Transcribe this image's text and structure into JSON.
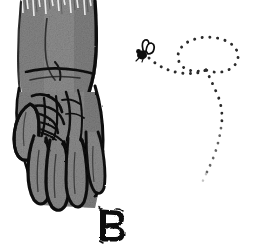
{
  "figure": {
    "label": "B",
    "caption": "Hand-drawn ink and grey wash illustration of a hand and forearm with a fly tracing a looping dotted flight path",
    "background_color": "#ffffff",
    "ink_color": "#111111",
    "wash_color": "#8b8b8b",
    "wash_color_dark": "#6f6f6f",
    "wash_color_light": "#a6a6a6",
    "trail_dot_color": "#2b2b2b",
    "trail_fade_color": "#c9c9c9",
    "width": 257,
    "height": 247
  },
  "subjects": {
    "hand": {
      "name": "hand",
      "description": "Back of a hand with four splayed fingers and a thumb at left, drawn in heavy black ink outline filled with grey pencil wash",
      "forearm_description": "Forearm rising to a ragged brush-cut top edge at the image border",
      "finger_count": 4,
      "thumb_count": 1
    },
    "fly": {
      "name": "fly",
      "description": "Small black insect with two outlined wings, hovering above and right of the hand",
      "x": 144,
      "y": 52
    },
    "flight_path": {
      "name": "flight-path",
      "description": "Dotted trail leaving the fly, sweeping right into a large oval loop and trailing away downward, fading out at the lower end",
      "style": "dotted",
      "loop_count": 1,
      "fades_out": true
    }
  },
  "label": {
    "text": "B",
    "x": 110,
    "y": 222,
    "style": "hand-lettered outline capital"
  }
}
